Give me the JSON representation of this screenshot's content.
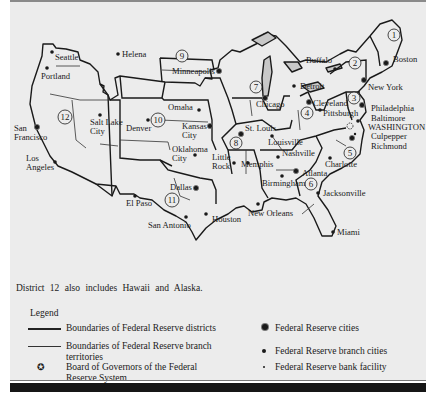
{
  "map": {
    "title": "Federal Reserve System districts map",
    "districts": [
      {
        "number": "1",
        "x": 394,
        "y": 35
      },
      {
        "number": "2",
        "x": 355,
        "y": 63
      },
      {
        "number": "3",
        "x": 354,
        "y": 98
      },
      {
        "number": "4",
        "x": 307,
        "y": 113
      },
      {
        "number": "5",
        "x": 380,
        "y": 153
      },
      {
        "number": "6",
        "x": 312,
        "y": 184
      },
      {
        "number": "7",
        "x": 255,
        "y": 85
      },
      {
        "number": "8",
        "x": 236,
        "y": 143
      },
      {
        "number": "9",
        "x": 182,
        "y": 56
      },
      {
        "number": "10",
        "x": 158,
        "y": 120
      },
      {
        "number": "11",
        "x": 101,
        "y": 200
      },
      {
        "number": "12",
        "x": 65,
        "y": 117
      }
    ],
    "cities": [
      {
        "name": "Seattle",
        "type": "branch",
        "x": 52,
        "y": 52,
        "lx": 55,
        "ly": 60,
        "lines": [
          "Seattle"
        ]
      },
      {
        "name": "Portland",
        "type": "branch",
        "x": 47,
        "y": 68,
        "lx": 41,
        "ly": 79,
        "lines": [
          "Portland"
        ]
      },
      {
        "name": "Helena",
        "type": "branch",
        "x": 118,
        "y": 54,
        "lx": 122,
        "ly": 57,
        "lines": [
          "Helena"
        ]
      },
      {
        "name": "Minneapolis",
        "type": "reserve",
        "x": 219,
        "y": 71,
        "lx": 172,
        "ly": 74,
        "lines": [
          "Minneapolis"
        ]
      },
      {
        "name": "San Francisco",
        "type": "reserve",
        "x": 37,
        "y": 127,
        "lx": 14,
        "ly": 131,
        "lines": [
          "San",
          "Francisco"
        ]
      },
      {
        "name": "Salt Lake City",
        "type": "branch",
        "x": 100,
        "y": 115,
        "lx": 90,
        "ly": 125,
        "lines": [
          "Salt Lake",
          "City"
        ]
      },
      {
        "name": "Denver",
        "type": "branch",
        "x": 148,
        "y": 120,
        "lx": 126,
        "ly": 131,
        "lines": [
          "Denver"
        ]
      },
      {
        "name": "Omaha",
        "type": "branch",
        "x": 199,
        "y": 110,
        "lx": 168,
        "ly": 110,
        "lines": [
          "Omaha"
        ]
      },
      {
        "name": "Kansas City",
        "type": "reserve",
        "x": 210,
        "y": 126,
        "lx": 182,
        "ly": 129,
        "lines": [
          "Kansas",
          "City"
        ]
      },
      {
        "name": "Oklahoma City",
        "type": "branch",
        "x": 195,
        "y": 155,
        "lx": 172,
        "ly": 152,
        "lines": [
          "Oklahoma",
          "City"
        ]
      },
      {
        "name": "Los Angeles",
        "type": "branch",
        "x": 55,
        "y": 162,
        "lx": 26,
        "ly": 161,
        "lines": [
          "Los",
          "Angeles"
        ]
      },
      {
        "name": "Dallas",
        "type": "reserve",
        "x": 196,
        "y": 188,
        "lx": 170,
        "ly": 190,
        "lines": [
          "Dallas"
        ]
      },
      {
        "name": "El Paso",
        "type": "branch",
        "x": 135,
        "y": 196,
        "lx": 126,
        "ly": 206,
        "lines": [
          "El Paso"
        ]
      },
      {
        "name": "San Antonio",
        "type": "branch",
        "x": 186,
        "y": 217,
        "lx": 148,
        "ly": 228,
        "lines": [
          "San Antonio"
        ]
      },
      {
        "name": "Houston",
        "type": "branch",
        "x": 206,
        "y": 214,
        "lx": 212,
        "ly": 222,
        "lines": [
          "Houston"
        ]
      },
      {
        "name": "Chicago",
        "type": "reserve",
        "x": 265,
        "y": 98,
        "lx": 256,
        "ly": 107,
        "lines": [
          "Chicago"
        ]
      },
      {
        "name": "Detroit",
        "type": "branch",
        "x": 294,
        "y": 86,
        "lx": 300,
        "ly": 89,
        "lines": [
          "Detroit"
        ]
      },
      {
        "name": "Buffalo",
        "type": "branch",
        "x": 335,
        "y": 69,
        "lx": 306,
        "ly": 63,
        "lines": [
          "Buffalo"
        ]
      },
      {
        "name": "Boston",
        "type": "reserve",
        "x": 386,
        "y": 63,
        "lx": 393,
        "ly": 62,
        "lines": [
          "Boston"
        ]
      },
      {
        "name": "New York",
        "type": "reserve",
        "x": 364,
        "y": 80,
        "lx": 368,
        "ly": 90,
        "lines": [
          "New York"
        ]
      },
      {
        "name": "Philadelphia",
        "type": "reserve",
        "x": 362,
        "y": 105,
        "lx": 371,
        "ly": 111,
        "lines": [
          "Philadelphia"
        ]
      },
      {
        "name": "Cleveland",
        "type": "reserve",
        "x": 309,
        "y": 102,
        "lx": 313,
        "ly": 106,
        "lines": [
          "Cleveland"
        ]
      },
      {
        "name": "Pittsburgh",
        "type": "branch",
        "x": 320,
        "y": 110,
        "lx": 323,
        "ly": 116,
        "lines": [
          "Pittsburgh"
        ]
      },
      {
        "name": "Baltimore",
        "type": "branch",
        "x": 358,
        "y": 121,
        "lx": 371,
        "ly": 121,
        "lines": [
          "Baltimore"
        ]
      },
      {
        "name": "WASHINGTON",
        "type": "board",
        "x": 350,
        "y": 126,
        "lx": 368,
        "ly": 130,
        "lines": [
          "WASHINGTON"
        ]
      },
      {
        "name": "Culpepper",
        "type": "facility",
        "x": 355,
        "y": 134,
        "lx": 371,
        "ly": 139,
        "lines": [
          "Culpepper"
        ]
      },
      {
        "name": "Richmond",
        "type": "reserve",
        "x": 352,
        "y": 138,
        "lx": 371,
        "ly": 149,
        "lines": [
          "Richmond"
        ]
      },
      {
        "name": "St. Louis",
        "type": "reserve",
        "x": 241,
        "y": 134,
        "lx": 245,
        "ly": 131,
        "lines": [
          "St. Louis"
        ]
      },
      {
        "name": "Louisville",
        "type": "branch",
        "x": 272,
        "y": 136,
        "lx": 268,
        "ly": 145,
        "lines": [
          "Louisville"
        ]
      },
      {
        "name": "Nashville",
        "type": "branch",
        "x": 278,
        "y": 157,
        "lx": 282,
        "ly": 156,
        "lines": [
          "Nashville"
        ]
      },
      {
        "name": "Little Rock",
        "type": "branch",
        "x": 234,
        "y": 163,
        "lx": 212,
        "ly": 160,
        "lines": [
          "Little",
          "Rock"
        ]
      },
      {
        "name": "Memphis",
        "type": "branch",
        "x": 248,
        "y": 163,
        "lx": 241,
        "ly": 167,
        "lines": [
          "Memphis"
        ]
      },
      {
        "name": "Charlotte",
        "type": "branch",
        "x": 330,
        "y": 158,
        "lx": 325,
        "ly": 167,
        "lines": [
          "Charlotte"
        ]
      },
      {
        "name": "Atlanta",
        "type": "reserve",
        "x": 296,
        "y": 171,
        "lx": 302,
        "ly": 176,
        "lines": [
          "Atlanta"
        ]
      },
      {
        "name": "Birmingham",
        "type": "branch",
        "x": 282,
        "y": 176,
        "lx": 262,
        "ly": 186,
        "lines": [
          "Birmingham"
        ]
      },
      {
        "name": "Jacksonville",
        "type": "branch",
        "x": 318,
        "y": 193,
        "lx": 323,
        "ly": 196,
        "lines": [
          "Jacksonville"
        ]
      },
      {
        "name": "New Orleans",
        "type": "branch",
        "x": 258,
        "y": 204,
        "lx": 248,
        "ly": 216,
        "lines": [
          "New Orleans"
        ]
      },
      {
        "name": "Miami",
        "type": "branch",
        "x": 333,
        "y": 232,
        "lx": 337,
        "ly": 235,
        "lines": [
          "Miami"
        ]
      }
    ]
  },
  "note": "District 12 also includes Hawaii and Alaska.",
  "legend": {
    "title": "Legend",
    "items": [
      {
        "symbol": "thick-line",
        "lines": [
          "Boundaries of Federal Reserve districts"
        ]
      },
      {
        "symbol": "thin-line",
        "lines": [
          "Boundaries of Federal Reserve branch",
          "territories"
        ]
      },
      {
        "symbol": "board-star",
        "lines": [
          "Board of Governors of the Federal",
          "Reserve System"
        ]
      },
      {
        "symbol": "reserve-dot",
        "lines": [
          "Federal Reserve cities"
        ]
      },
      {
        "symbol": "branch-dot",
        "lines": [
          "Federal Reserve branch cities"
        ]
      },
      {
        "symbol": "facility-dot",
        "lines": [
          "Federal Reserve bank facility"
        ]
      }
    ]
  },
  "colors": {
    "panel": "#ececec",
    "ink": "#1a1a1a",
    "lakes": "#c8c8c8",
    "bar": "#161616"
  }
}
